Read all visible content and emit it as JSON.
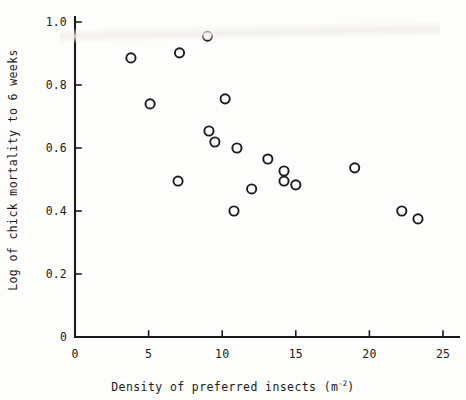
{
  "figure": {
    "background_color": "#fdfdfc",
    "ink_color": "#1b1b1b"
  },
  "axes": {
    "x_title_main": "Density of preferred insects (m",
    "x_title_sup": "-2",
    "x_title_close": ")",
    "y_title": "Log of chick mortality to 6 weeks",
    "x_ticks": [
      "0",
      "5",
      "10",
      "15",
      "20",
      "25"
    ],
    "y_ticks": [
      "1.0",
      "0.8",
      "0.6",
      "0.4",
      "0.2",
      "0"
    ]
  },
  "chart_data": {
    "type": "scatter",
    "title": "",
    "xlabel": "Density of preferred insects (m-2)",
    "ylabel": "Log of chick mortality to 6 weeks",
    "xlim": [
      0,
      25.8
    ],
    "ylim": [
      0,
      1.05
    ],
    "xticks": [
      0,
      5,
      10,
      15,
      20,
      25
    ],
    "yticks": [
      0,
      0.2,
      0.4,
      0.6,
      0.8,
      1.0
    ],
    "grid": false,
    "legend": null,
    "marker": "open-circle",
    "marker_color": "#1b1b1b",
    "points": [
      {
        "x": 3.8,
        "y": 0.886
      },
      {
        "x": 5.1,
        "y": 0.74
      },
      {
        "x": 7.0,
        "y": 0.495
      },
      {
        "x": 7.1,
        "y": 0.902
      },
      {
        "x": 9.0,
        "y": 0.955
      },
      {
        "x": 9.1,
        "y": 0.654
      },
      {
        "x": 9.5,
        "y": 0.619
      },
      {
        "x": 10.2,
        "y": 0.756
      },
      {
        "x": 10.8,
        "y": 0.4
      },
      {
        "x": 11.0,
        "y": 0.6
      },
      {
        "x": 12.0,
        "y": 0.47
      },
      {
        "x": 13.1,
        "y": 0.565
      },
      {
        "x": 14.2,
        "y": 0.527
      },
      {
        "x": 14.2,
        "y": 0.495
      },
      {
        "x": 15.0,
        "y": 0.483
      },
      {
        "x": 19.0,
        "y": 0.537
      },
      {
        "x": 22.2,
        "y": 0.4
      },
      {
        "x": 23.3,
        "y": 0.375
      }
    ]
  },
  "geometry": {
    "origin_x": 75,
    "origin_y": 337,
    "x_unit_px": 14.72,
    "y_unit_px": 315,
    "x_axis_end": 459,
    "y_axis_top": 17,
    "marker_radius": 4.6
  }
}
